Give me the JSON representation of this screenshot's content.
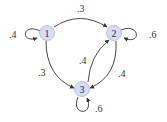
{
  "diagram": {
    "type": "markov-chain-state-diagram",
    "colors": {
      "node_fill": "#d6ddf5",
      "node_stroke": "#a9b6e0",
      "node_text": "#1a2a6a",
      "edge": "#333333",
      "label": "#333333"
    },
    "nodes": [
      {
        "id": "1",
        "label": "1",
        "cx": 47,
        "cy": 33
      },
      {
        "id": "2",
        "label": "2",
        "cx": 114,
        "cy": 33
      },
      {
        "id": "3",
        "label": "3",
        "cx": 82,
        "cy": 89
      }
    ],
    "edges": [
      {
        "from": "1",
        "to": "1",
        "label": ".4"
      },
      {
        "from": "1",
        "to": "2",
        "label": ".3"
      },
      {
        "from": "1",
        "to": "3",
        "label": ".3"
      },
      {
        "from": "2",
        "to": "2",
        "label": ".6"
      },
      {
        "from": "2",
        "to": "3",
        "label": ".4"
      },
      {
        "from": "3",
        "to": "2",
        "label": ".4"
      },
      {
        "from": "3",
        "to": "3",
        "label": ".6"
      }
    ]
  }
}
